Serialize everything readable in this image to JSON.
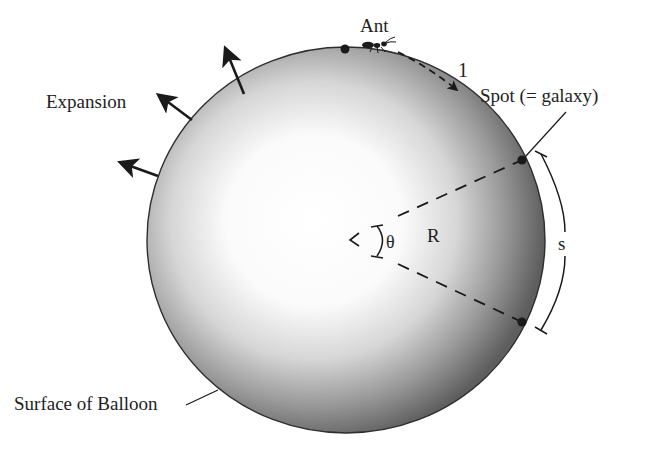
{
  "figure": {
    "type": "expanding-balloon-universe-analogy",
    "labels": {
      "ant": "Ant",
      "distance_marker": "1",
      "spot": "Spot (= galaxy)",
      "expansion": "Expansion",
      "surface": "Surface of Balloon",
      "radius": "R",
      "angle": "θ",
      "arc_length": "s"
    },
    "colors": {
      "ink": "#1a1a1a",
      "balloon_edge": "#3a3a3a",
      "balloon_center": "#ffffff",
      "balloon_rim": "#5a5a5a",
      "background": "#ffffff"
    },
    "elements": {
      "expansion_arrows": 3,
      "spots_on_surface": 3,
      "dashed_radii": 2
    }
  }
}
